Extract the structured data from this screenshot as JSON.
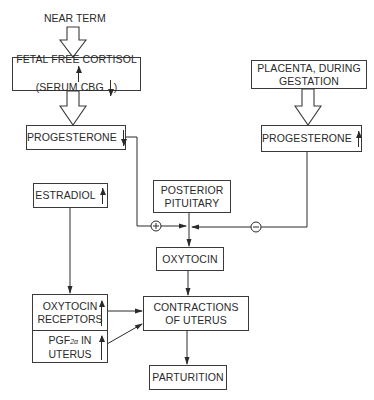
{
  "diagram": {
    "start_label": "NEAR TERM",
    "nodes": {
      "fetal_cortisol": {
        "line1": "FETAL FREE CORTISOL",
        "line1_direction": "up",
        "line2": "(SERUM CBG",
        "line2_direction": "down",
        "line2_close": ")"
      },
      "progesterone_left": {
        "label": "PROGESTERONE",
        "direction": "down"
      },
      "placenta": {
        "line1": "PLACENTA, DURING",
        "line2": "GESTATION"
      },
      "progesterone_right": {
        "label": "PROGESTERONE",
        "direction": "up"
      },
      "estradiol": {
        "label": "ESTRADIOL",
        "direction": "up"
      },
      "posterior_pituitary": {
        "line1": "POSTERIOR",
        "line2": "PITUITARY"
      },
      "oxytocin": {
        "label": "OXYTOCIN"
      },
      "oxytocin_receptors": {
        "line1": "OXYTOCIN",
        "line2": "RECEPTORS",
        "direction": "up"
      },
      "pgf_uterus": {
        "line1_prefix": "PGF",
        "line1_sub": "2α",
        "line1_suffix": " IN",
        "line2": "UTERUS",
        "direction": "up"
      },
      "contractions": {
        "line1": "CONTRACTIONS",
        "line2": "OF UTERUS"
      },
      "parturition": {
        "label": "PARTURITION"
      }
    },
    "signs": {
      "stimulate": "+",
      "inhibit": "−"
    },
    "edges": [
      {
        "from": "near_term",
        "to": "fetal_cortisol",
        "style": "hollow-arrow"
      },
      {
        "from": "fetal_cortisol",
        "to": "progesterone_left",
        "style": "hollow-arrow"
      },
      {
        "from": "placenta",
        "to": "progesterone_right",
        "style": "hollow-arrow"
      },
      {
        "from": "progesterone_left",
        "to": "oxytocin",
        "sign": "+"
      },
      {
        "from": "progesterone_right",
        "to": "oxytocin",
        "sign": "−"
      },
      {
        "from": "posterior_pituitary",
        "to": "oxytocin"
      },
      {
        "from": "estradiol",
        "to": "oxytocin_receptors"
      },
      {
        "from": "oxytocin",
        "to": "contractions"
      },
      {
        "from": "oxytocin_receptors",
        "to": "contractions"
      },
      {
        "from": "pgf_uterus",
        "to": "contractions"
      },
      {
        "from": "contractions",
        "to": "parturition"
      }
    ]
  }
}
